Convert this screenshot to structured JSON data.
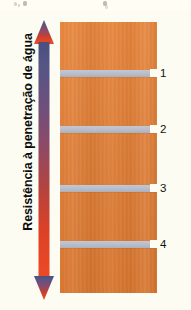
{
  "figure": {
    "title_label": "Resistência à penetração de água",
    "background_color": "#fdfcf2"
  },
  "axis_arrow": {
    "name": "resistance-gradient-arrow",
    "direction": "double-headed-vertical",
    "top_color": "#4f5282",
    "mid_color": "#8c4a62",
    "bottom_color": "#e8452a",
    "meaning_top": "maior resistência",
    "meaning_bottom": "menor resistência"
  },
  "block": {
    "name": "masonry-wall-section",
    "fill_color": "#df7e37",
    "joint_color": "#b9bdc9"
  },
  "joints": [
    {
      "id": "1",
      "label": "1",
      "top": 48
    },
    {
      "id": "2",
      "label": "2",
      "top": 104
    },
    {
      "id": "3",
      "label": "3",
      "top": 163
    },
    {
      "id": "4",
      "label": "4",
      "top": 219
    }
  ]
}
